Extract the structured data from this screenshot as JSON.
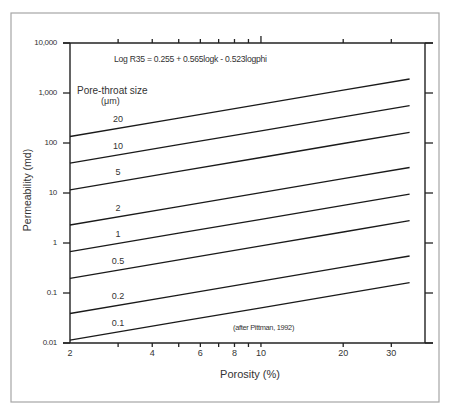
{
  "chart_data": {
    "type": "line",
    "title": "",
    "equation": "Log R35 = 0.255 + 0.565logk - 0.523logphi",
    "legend_title": "Pore-throat size",
    "legend_unit": "(μm)",
    "annotation": "(after Pittman, 1992)",
    "xlabel": "Porosity (%)",
    "ylabel": "Permeability (md)",
    "xscale": "log",
    "yscale": "log",
    "xlim": [
      2,
      40
    ],
    "ylim": [
      0.01,
      10000
    ],
    "grid": false,
    "legend_position": "inline labels above each line",
    "x_ticks": [
      2,
      3,
      4,
      5,
      6,
      7,
      8,
      9,
      10,
      20,
      30
    ],
    "x_tick_labels": [
      "2",
      "4",
      "6",
      "8",
      "10",
      "20",
      "30"
    ],
    "y_ticks": [
      10000,
      1000,
      100,
      10,
      1,
      0.1,
      0.01
    ],
    "y_tick_labels": [
      "10,000",
      "1,000",
      "100",
      "10",
      "1",
      "0.1",
      "0.01"
    ],
    "x": [
      2,
      5,
      10,
      20,
      35
    ],
    "series": [
      {
        "name": "20",
        "values": [
          135,
          315,
          598,
          1137,
          1908
        ]
      },
      {
        "name": "10",
        "values": [
          39.6,
          92.4,
          175.5,
          333,
          559
        ]
      },
      {
        "name": "5",
        "values": [
          11.6,
          27.1,
          51.4,
          97.7,
          164
        ]
      },
      {
        "name": "2",
        "values": [
          2.29,
          5.35,
          10.2,
          19.3,
          32.4
        ]
      },
      {
        "name": "1",
        "values": [
          0.672,
          1.57,
          2.98,
          5.66,
          9.5
        ]
      },
      {
        "name": "0.5",
        "values": [
          0.197,
          0.46,
          0.874,
          1.66,
          2.79
        ]
      },
      {
        "name": "0.2",
        "values": [
          0.0389,
          0.0909,
          0.173,
          0.328,
          0.55
        ]
      },
      {
        "name": "0.1",
        "values": [
          0.0114,
          0.0267,
          0.0506,
          0.0962,
          0.161
        ]
      }
    ]
  }
}
